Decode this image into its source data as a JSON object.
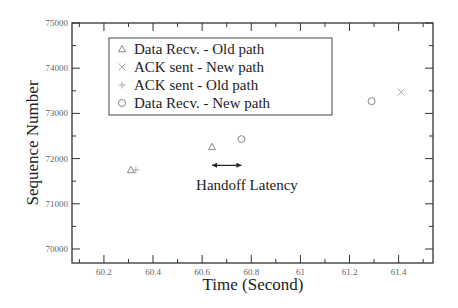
{
  "chart_data": {
    "type": "scatter",
    "title": "",
    "xlabel": "Time (Second)",
    "ylabel": "Sequence Number",
    "xlim": [
      60.07,
      61.54
    ],
    "ylim": [
      69690,
      75000
    ],
    "x_ticks": [
      60.2,
      60.4,
      60.6,
      60.8,
      61,
      61.2,
      61.4
    ],
    "x_tick_labels": [
      "60.2",
      "60.4",
      "60.6",
      "60.8",
      "61",
      "61.2",
      "61.4"
    ],
    "y_ticks": [
      70000,
      71000,
      72000,
      73000,
      74000,
      75000
    ],
    "y_tick_labels": [
      "70000",
      "71000",
      "72000",
      "73000",
      "74000",
      "75000"
    ],
    "grid": false,
    "legend_position": "upper left",
    "series": [
      {
        "name": "Data Recv. - Old path",
        "marker": "triangle",
        "color": "#888888",
        "points": [
          [
            60.31,
            71750
          ],
          [
            60.64,
            72260
          ]
        ]
      },
      {
        "name": "ACK sent - New path",
        "marker": "x",
        "color": "#aaaaaa",
        "points": [
          [
            61.41,
            73470
          ]
        ]
      },
      {
        "name": "ACK sent - Old path",
        "marker": "plus",
        "color": "#aaaaaa",
        "points": [
          [
            60.33,
            71750
          ]
        ]
      },
      {
        "name": "Data Recv. - New path",
        "marker": "circle",
        "color": "#888888",
        "points": [
          [
            60.76,
            72430
          ],
          [
            61.29,
            73270
          ]
        ]
      }
    ],
    "annotations": [
      {
        "text": "Handoff Latency",
        "type": "double-arrow",
        "x_from": 60.64,
        "x_to": 60.76,
        "y": 71850
      }
    ]
  }
}
